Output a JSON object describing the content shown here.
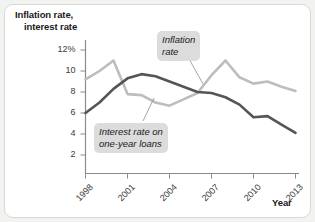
{
  "figure": {
    "border_color": "#d8d8d4",
    "background": "#ffffff",
    "outer_background": "#f2f2f0"
  },
  "axes": {
    "y_title_line1": "Inflation rate,",
    "y_title_line2": "interest rate",
    "x_title": "Year"
  },
  "callouts": {
    "inflation_line1": "Inflation",
    "inflation_line2": "rate",
    "interest_line1": "Interest rate on",
    "interest_line2": "one-year loans"
  },
  "chart_data": {
    "type": "line",
    "title": "",
    "xlabel": "Year",
    "ylabel": "Inflation rate, interest rate",
    "xlim": [
      1998,
      2013
    ],
    "ylim": [
      0,
      13
    ],
    "grid": false,
    "legend_position": "inline-callouts",
    "x_tick_labels": [
      "1998",
      "2001",
      "2004",
      "2007",
      "2010",
      "2013"
    ],
    "x_ticks": [
      1998,
      2001,
      2004,
      2007,
      2010,
      2013
    ],
    "y_tick_labels": [
      "12%",
      "10",
      "8",
      "6",
      "4",
      "2"
    ],
    "y_ticks": [
      12,
      10,
      8,
      6,
      4,
      2
    ],
    "x": [
      1998,
      1999,
      2000,
      2001,
      2002,
      2003,
      2004,
      2005,
      2006,
      2007,
      2008,
      2009,
      2010,
      2011,
      2012,
      2013
    ],
    "series": [
      {
        "name": "Inflation rate",
        "color": "#bdbdbd",
        "values": [
          9.2,
          10.0,
          11.0,
          7.8,
          7.7,
          7.0,
          6.7,
          7.3,
          7.9,
          9.6,
          11.0,
          9.4,
          8.8,
          9.0,
          8.5,
          8.1
        ]
      },
      {
        "name": "Interest rate on one-year loans",
        "color": "#555555",
        "values": [
          6.0,
          7.0,
          8.3,
          9.3,
          9.7,
          9.5,
          9.0,
          8.5,
          8.0,
          7.9,
          7.5,
          6.8,
          5.6,
          5.7,
          4.9,
          4.1
        ]
      }
    ],
    "annotations": [
      {
        "text": "Inflation rate",
        "target_x": 2005,
        "target_y": 8.5
      },
      {
        "text": "Interest rate on one-year loans",
        "target_x": 2003.3,
        "target_y": 7.2
      }
    ]
  }
}
